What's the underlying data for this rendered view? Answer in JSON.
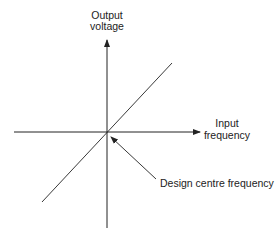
{
  "diagram": {
    "title": "",
    "y_axis": {
      "label_line1": "Output",
      "label_line2": "voltage"
    },
    "x_axis": {
      "label_line1": "Input",
      "label_line2": "frequency"
    },
    "annotation": {
      "text": "Design centre frequency",
      "points_to": "origin"
    },
    "line": {
      "relation": "linear",
      "slope_sign": "positive",
      "passes_through": "origin"
    },
    "colors": {
      "ink": "#222222",
      "background": "#ffffff"
    }
  }
}
